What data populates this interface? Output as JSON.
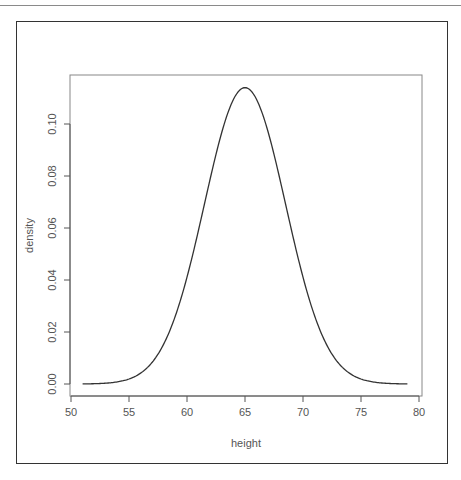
{
  "chart_data": {
    "type": "line",
    "title": "",
    "xlabel": "height",
    "ylabel": "density",
    "xlim": [
      50,
      80
    ],
    "ylim": [
      0,
      0.1175
    ],
    "x_ticks": [
      50,
      55,
      60,
      65,
      70,
      75,
      80
    ],
    "x_tick_labels": [
      "50",
      "55",
      "60",
      "65",
      "70",
      "75",
      "80"
    ],
    "y_ticks": [
      0.0,
      0.02,
      0.04,
      0.06,
      0.08,
      0.1
    ],
    "y_tick_labels": [
      "0.00",
      "0.02",
      "0.04",
      "0.06",
      "0.08",
      "0.10"
    ],
    "grid": false,
    "series": [
      {
        "name": "normal density",
        "distribution": "normal",
        "mean": 65,
        "sd": 3.5,
        "x_range": [
          51,
          79
        ],
        "peak_density": 0.114
      }
    ],
    "colors": {
      "line": "#333333",
      "axis": "#555555"
    }
  }
}
